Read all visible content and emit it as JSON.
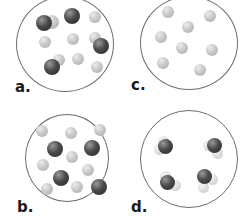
{
  "figure": {
    "panels": [
      {
        "id": "a",
        "label": "a.",
        "description": "mixture of elements and compounds (diatomic molecules of two different atoms plus single atoms)"
      },
      {
        "id": "b",
        "label": "b.",
        "description": "mixture of two elements (separate dark and light atoms)"
      },
      {
        "id": "c",
        "label": "c.",
        "description": "pure element (light atoms only)"
      },
      {
        "id": "d",
        "label": "d.",
        "description": "pure compound (molecules of one dark atom bonded to light atoms)"
      }
    ]
  },
  "colors": {
    "ring": "#6b6b6b",
    "light_atom": "#c9c9c9",
    "dark_atom": "#4a4a4a",
    "label": "#1a1a1a"
  }
}
